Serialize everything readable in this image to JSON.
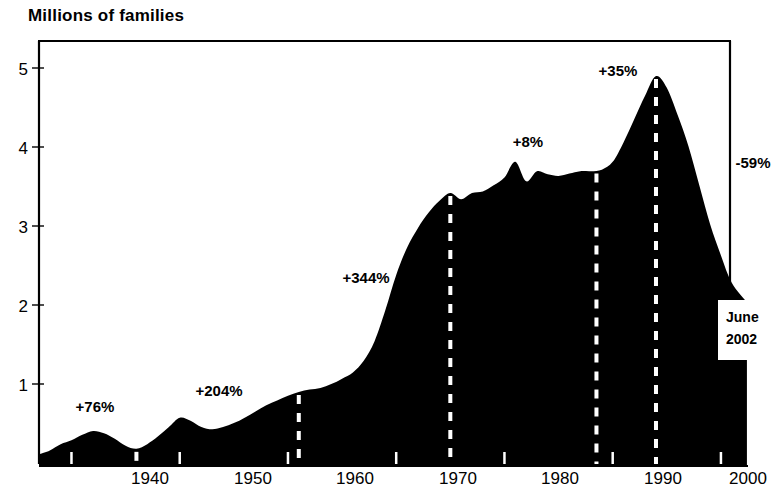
{
  "chart": {
    "title": "Millions of families",
    "endcap": {
      "line1": "June",
      "line2": "2002"
    }
  },
  "chart_data": {
    "type": "area",
    "title": "Millions of families",
    "xlabel": "",
    "ylabel": "Millions of families",
    "xlim": [
      1937,
      2002.5
    ],
    "ylim": [
      0,
      5.45
    ],
    "grid": false,
    "legend": null,
    "fill_color": "#000000",
    "background_color": "#ffffff",
    "xticks": [
      1940,
      1950,
      1960,
      1970,
      1980,
      1990,
      2000
    ],
    "xtick_labels": [
      "1940",
      "1950",
      "1960",
      "1970",
      "1980",
      "1990",
      "2000"
    ],
    "yticks": [
      1,
      2,
      3,
      4,
      5
    ],
    "ytick_labels": [
      "1",
      "2",
      "3",
      "4",
      "5"
    ],
    "x": [
      1937,
      1938,
      1939,
      1940,
      1941,
      1942,
      1943,
      1944,
      1945,
      1946,
      1947,
      1948,
      1949,
      1950,
      1951,
      1952,
      1953,
      1954,
      1955,
      1956,
      1957,
      1958,
      1959,
      1960,
      1961,
      1962,
      1963,
      1964,
      1965,
      1966,
      1967,
      1968,
      1969,
      1970,
      1971,
      1972,
      1973,
      1974,
      1975,
      1976,
      1977,
      1978,
      1979,
      1980,
      1981,
      1982,
      1983,
      1984,
      1985,
      1986,
      1987,
      1988,
      1989,
      1990,
      1991,
      1992,
      1993,
      1994,
      1995,
      1996,
      1997,
      1998,
      1999,
      2000,
      2001,
      2002.4
    ],
    "y": [
      0.15,
      0.2,
      0.28,
      0.33,
      0.4,
      0.45,
      0.42,
      0.35,
      0.26,
      0.22,
      0.28,
      0.38,
      0.5,
      0.62,
      0.58,
      0.5,
      0.47,
      0.5,
      0.55,
      0.62,
      0.7,
      0.78,
      0.84,
      0.9,
      0.95,
      0.98,
      1.0,
      1.05,
      1.12,
      1.2,
      1.35,
      1.6,
      2.0,
      2.45,
      2.8,
      3.05,
      3.25,
      3.4,
      3.5,
      3.42,
      3.5,
      3.52,
      3.6,
      3.7,
      3.9,
      3.65,
      3.78,
      3.74,
      3.72,
      3.75,
      3.78,
      3.78,
      3.8,
      3.9,
      4.15,
      4.45,
      4.75,
      5.0,
      4.85,
      4.5,
      4.1,
      3.6,
      3.1,
      2.7,
      2.35,
      2.1
    ],
    "reference_lines": [
      {
        "x": 1946,
        "style": "dashed",
        "color": "#ffffff",
        "label": null
      },
      {
        "x": 1961,
        "style": "dashed",
        "color": "#ffffff",
        "label": null
      },
      {
        "x": 1975,
        "style": "dashed",
        "color": "#ffffff",
        "label": null
      },
      {
        "x": 1988.5,
        "style": "dashed",
        "color": "#ffffff",
        "label": null
      },
      {
        "x": 1994,
        "style": "dashed",
        "color": "#ffffff",
        "label": null
      }
    ],
    "annotations": [
      {
        "text": "+76%",
        "x": 1942.5,
        "y": 0.85,
        "segment": "1937-1946"
      },
      {
        "text": "+204%",
        "x": 1955.5,
        "y": 1.25,
        "segment": "1946-1961"
      },
      {
        "text": "+344%",
        "x": 1967.5,
        "y": 2.25,
        "segment": "1961-1975"
      },
      {
        "text": "+8%",
        "x": 1982.5,
        "y": 4.3,
        "segment": "1975-1988"
      },
      {
        "text": "+35%",
        "x": 1991.5,
        "y": 4.95,
        "segment": "1988-1994"
      },
      {
        "text": "-59%",
        "x": 2001.5,
        "y": 3.7,
        "segment": "1994-2002"
      }
    ],
    "final_value_label": "June 2002"
  }
}
